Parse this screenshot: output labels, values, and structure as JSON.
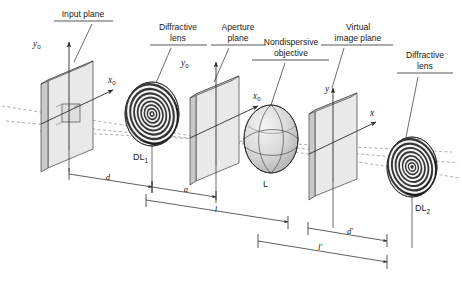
{
  "figure": {
    "background": "#ffffff",
    "width": 462,
    "height": 283
  },
  "callouts": [
    {
      "id": "input-plane",
      "label_line1": "Input plane",
      "label_line2": "",
      "x": 83,
      "y": 17
    },
    {
      "id": "diffractive-lens-1",
      "label_line1": "Diffractive",
      "label_line2": "lens",
      "x": 178,
      "y": 30
    },
    {
      "id": "aperture-plane",
      "label_line1": "Aperture",
      "label_line2": "plane",
      "x": 238,
      "y": 30
    },
    {
      "id": "nondispersive-objective",
      "label_line1": "Nondispersive",
      "label_line2": "objective",
      "x": 291,
      "y": 45
    },
    {
      "id": "virtual-image-plane",
      "label_line1": "Virtual",
      "label_line2": "image plane",
      "x": 358,
      "y": 30
    },
    {
      "id": "diffractive-lens-2",
      "label_line1": "Diffractive",
      "label_line2": "lens",
      "x": 425,
      "y": 58
    }
  ],
  "elements": [
    {
      "id": "dl1",
      "label": "DL",
      "subscript": "1"
    },
    {
      "id": "objective",
      "label": "L",
      "subscript": ""
    },
    {
      "id": "dl2",
      "label": "DL",
      "subscript": "2"
    }
  ],
  "axes": [
    {
      "id": "input-y",
      "label": "y",
      "subscript": "0"
    },
    {
      "id": "input-x",
      "label": "x",
      "subscript": "0"
    },
    {
      "id": "aperture-y",
      "label": "y",
      "subscript": "0"
    },
    {
      "id": "aperture-x",
      "label": "x",
      "subscript": "0"
    },
    {
      "id": "image-y",
      "label": "y",
      "subscript": ""
    },
    {
      "id": "image-x",
      "label": "x",
      "subscript": ""
    }
  ],
  "dimensions": [
    {
      "id": "d",
      "label": "d",
      "prime": "",
      "from": "input-plane",
      "to": "diffractive-lens-1"
    },
    {
      "id": "a",
      "label": "a",
      "prime": "",
      "from": "diffractive-lens-1",
      "to": "aperture-plane"
    },
    {
      "id": "l",
      "label": "l",
      "prime": "",
      "from": "input-plane",
      "to": "virtual-image-plane"
    },
    {
      "id": "d-prime",
      "label": "d",
      "prime": "'",
      "from": "virtual-image-plane",
      "to": "diffractive-lens-2"
    },
    {
      "id": "l-prime",
      "label": "l",
      "prime": "'",
      "from": "aperture-plane",
      "to": "diffractive-lens-2"
    }
  ],
  "colors": {
    "line": "#2b2b2b",
    "leader": "#3a3a3a",
    "ray": "#8d8d8d",
    "glass_face": "#e9e9e9",
    "glass_side": "#c9c9c9"
  }
}
